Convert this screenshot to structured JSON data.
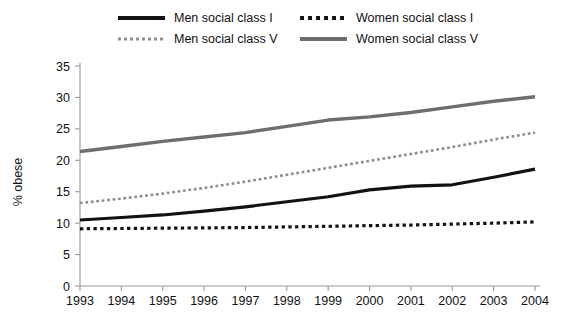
{
  "legend": {
    "entries": [
      {
        "label": "Men social class I",
        "style": "solid-black",
        "key": "men_I"
      },
      {
        "label": "Men social class V",
        "style": "dot-gray",
        "key": "men_V"
      },
      {
        "label": "Women social class I",
        "style": "dot-black",
        "key": "women_I"
      },
      {
        "label": "Women social class V",
        "style": "solid-gray",
        "key": "women_V"
      }
    ]
  },
  "axes": {
    "y_title": "% obese",
    "y_ticks": [
      "0",
      "5",
      "10",
      "15",
      "20",
      "25",
      "30",
      "35"
    ],
    "x_ticks": [
      "1993",
      "1994",
      "1995",
      "1996",
      "1997",
      "1998",
      "1999",
      "2000",
      "2001",
      "2002",
      "2003",
      "2004"
    ]
  },
  "colors": {
    "men_I": "#121212",
    "men_V": "#8d8d8d",
    "women_I": "#141414",
    "women_V": "#6e6e6e",
    "axis": "#9a9a9a",
    "text": "#111111",
    "background": "#ffffff"
  },
  "chart_data": {
    "type": "line",
    "title": "",
    "xlabel": "",
    "ylabel": "% obese",
    "x": [
      "1993",
      "1994",
      "1995",
      "1996",
      "1997",
      "1998",
      "1999",
      "2000",
      "2001",
      "2002",
      "2003",
      "2004"
    ],
    "xlim": [
      "1993",
      "2004"
    ],
    "ylim": [
      0,
      35
    ],
    "ytick_step": 5,
    "grid": false,
    "legend_position": "top",
    "series": [
      {
        "name": "Men social class I",
        "key": "men_I",
        "color": "#121212",
        "line_style": "solid",
        "line_width": 3.2,
        "values": [
          10.5,
          10.9,
          11.3,
          11.9,
          12.6,
          13.4,
          14.2,
          15.3,
          15.9,
          16.1,
          17.3,
          18.6
        ]
      },
      {
        "name": "Men social class V",
        "key": "men_V",
        "color": "#8d8d8d",
        "line_style": "dotted",
        "line_width": 2.6,
        "values": [
          13.2,
          13.9,
          14.7,
          15.6,
          16.6,
          17.7,
          18.8,
          19.9,
          21.0,
          22.1,
          23.3,
          24.4
        ]
      },
      {
        "name": "Women social class I",
        "key": "women_I",
        "color": "#141414",
        "line_style": "dotted",
        "line_width": 3.2,
        "values": [
          9.1,
          9.15,
          9.2,
          9.25,
          9.3,
          9.4,
          9.5,
          9.6,
          9.7,
          9.85,
          10.0,
          10.2
        ]
      },
      {
        "name": "Women social class V",
        "key": "women_V",
        "color": "#6e6e6e",
        "line_style": "solid",
        "line_width": 3.4,
        "values": [
          21.4,
          22.2,
          23.0,
          23.7,
          24.4,
          25.4,
          26.4,
          26.9,
          27.6,
          28.5,
          29.4,
          30.1
        ]
      }
    ]
  }
}
